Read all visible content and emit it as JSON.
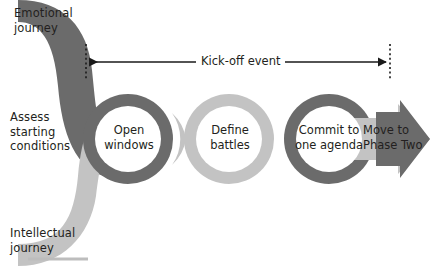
{
  "diagram": {
    "type": "process-flow",
    "colors": {
      "dark_band": "#6b6b6b",
      "light_band": "#c3c3c3",
      "node_fill": "#ffffff",
      "text": "#231f20",
      "arrow_line": "#1a1a1a",
      "footer_rule": "#bdbdbd"
    },
    "journeys": [
      {
        "id": "emotional",
        "label": "Emotional\njourney",
        "band": "dark",
        "origin": "top-left"
      },
      {
        "id": "intellectual",
        "label": "Intellectual\njourney",
        "band": "light",
        "origin": "bottom-left"
      }
    ],
    "start_label": "Assess\nstarting\nconditions",
    "kickoff": {
      "label": "Kick-off event",
      "arrow": "double-headed",
      "marker_style": "dotted-vertical"
    },
    "steps": [
      {
        "id": "open-windows",
        "label": "Open\nwindows",
        "ring": "dark"
      },
      {
        "id": "define-battles",
        "label": "Define\nbattles",
        "ring": "light"
      },
      {
        "id": "commit-agenda",
        "label": "Commit to\none agenda",
        "ring": "dark"
      }
    ],
    "exit": {
      "label": "Move to\nPhase Two",
      "shape": "block-arrow",
      "fill": "dark"
    }
  }
}
